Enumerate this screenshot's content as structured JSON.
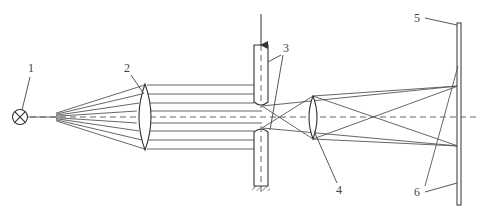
{
  "diagram": {
    "title": "",
    "labels": [
      {
        "id": "1",
        "text": "1",
        "meaning": "light source"
      },
      {
        "id": "2",
        "text": "2",
        "meaning": "collimating lens"
      },
      {
        "id": "3",
        "text": "3",
        "meaning": "cylinders (slit)"
      },
      {
        "id": "4",
        "text": "4",
        "meaning": "imaging lens"
      },
      {
        "id": "5",
        "text": "5",
        "meaning": "screen"
      },
      {
        "id": "6",
        "text": "6",
        "meaning": "image rays"
      }
    ],
    "colors": {
      "line": "#555555",
      "background": "#ffffff"
    }
  }
}
